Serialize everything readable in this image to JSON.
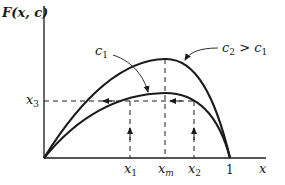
{
  "diagram": {
    "y_axis_label": "F(x, c)",
    "x_axis_label": "x",
    "curves": [
      {
        "name": "c1",
        "label_main": "c",
        "label_sub": "1",
        "description": "lower hump curve"
      },
      {
        "name": "c2",
        "label_main": "c",
        "label_sub": "2",
        "label_suffix": " > ",
        "label_suffix_main": "c",
        "label_suffix_sub": "1",
        "description": "upper hump curve"
      }
    ],
    "x_ticks": [
      {
        "main": "x",
        "sub": "1"
      },
      {
        "main": "x",
        "sub": "m"
      },
      {
        "main": "x",
        "sub": "2"
      },
      {
        "main": "1",
        "sub": ""
      }
    ],
    "y_ticks": [
      {
        "main": "x",
        "sub": "3"
      }
    ],
    "colors": {
      "ink": "#1a1a1a",
      "background": "#ffffff"
    }
  }
}
